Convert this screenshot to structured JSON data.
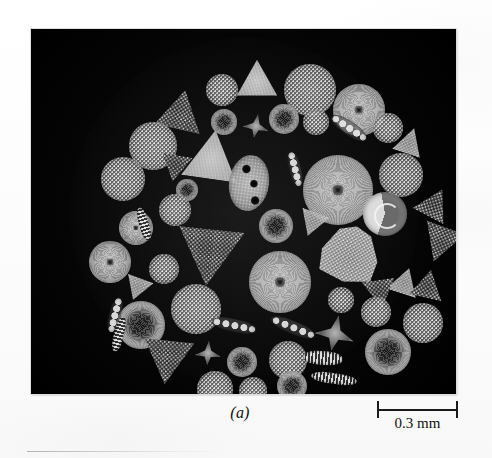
{
  "figure": {
    "caption": "(a)",
    "scale_bar": {
      "label": "0.3 mm",
      "length_px": 81
    },
    "plate": {
      "background_color": "#050505",
      "description": "Dark-field micrograph of an arranged slide of diatom frustules forming a circular mosaic"
    }
  },
  "colors": {
    "page_background": "#ffffff",
    "plate_background": "#050505",
    "ink": "#111111",
    "rule": "#787878"
  },
  "specimens": [
    {
      "name": "triangular-dark-1",
      "type": "triangle-dark",
      "x": 126,
      "y": 60,
      "w": 48,
      "h": 42,
      "rot": 12
    },
    {
      "name": "centric-porous-1",
      "type": "porous",
      "x": 175,
      "y": 45,
      "w": 32,
      "h": 32,
      "rot": 0
    },
    {
      "name": "triangular-bright-1",
      "type": "triangle-bright",
      "x": 205,
      "y": 30,
      "w": 42,
      "h": 38,
      "rot": 0
    },
    {
      "name": "centric-porous-2",
      "type": "porous",
      "x": 253,
      "y": 35,
      "w": 52,
      "h": 52,
      "rot": 0
    },
    {
      "name": "centric-radial-1",
      "type": "centric",
      "x": 302,
      "y": 55,
      "w": 52,
      "h": 52,
      "rot": 0
    },
    {
      "name": "centric-porous-3",
      "type": "porous",
      "x": 342,
      "y": 84,
      "w": 30,
      "h": 30,
      "rot": 0
    },
    {
      "name": "triangular-mid-1",
      "type": "triangle",
      "x": 364,
      "y": 98,
      "w": 30,
      "h": 28,
      "rot": 18
    },
    {
      "name": "centric-porous-4",
      "type": "porous",
      "x": 98,
      "y": 93,
      "w": 48,
      "h": 48,
      "rot": 0
    },
    {
      "name": "centric-ring-1",
      "type": "ring",
      "x": 180,
      "y": 80,
      "w": 26,
      "h": 26,
      "rot": 0
    },
    {
      "name": "triradiate-1",
      "type": "triradiate",
      "x": 212,
      "y": 85,
      "w": 26,
      "h": 24,
      "rot": 10
    },
    {
      "name": "centric-ring-2",
      "type": "ring",
      "x": 238,
      "y": 75,
      "w": 30,
      "h": 30,
      "rot": 0
    },
    {
      "name": "centric-porous-5",
      "type": "porous",
      "x": 272,
      "y": 80,
      "w": 26,
      "h": 26,
      "rot": 0
    },
    {
      "name": "rod-chain-1",
      "type": "rod-lumpy",
      "x": 297,
      "y": 92,
      "w": 42,
      "h": 14,
      "rot": 34
    },
    {
      "name": "triangular-bright-2",
      "type": "triangle-bright",
      "x": 152,
      "y": 100,
      "w": 58,
      "h": 52,
      "rot": 8
    },
    {
      "name": "triangular-dark-2",
      "type": "triangle-dark",
      "x": 128,
      "y": 125,
      "w": 32,
      "h": 28,
      "rot": 190
    },
    {
      "name": "centric-porous-6",
      "type": "porous",
      "x": 70,
      "y": 128,
      "w": 44,
      "h": 44,
      "rot": 0
    },
    {
      "name": "ellipse-ocelli-1",
      "type": "ellipse-ocelli",
      "x": 198,
      "y": 126,
      "w": 40,
      "h": 56,
      "rot": 8
    },
    {
      "name": "rod-chain-2",
      "type": "rod-lumpy",
      "x": 246,
      "y": 134,
      "w": 36,
      "h": 12,
      "rot": 76
    },
    {
      "name": "centric-radial-large-1",
      "type": "centric",
      "x": 272,
      "y": 126,
      "w": 70,
      "h": 70,
      "rot": 0
    },
    {
      "name": "centric-porous-7",
      "type": "porous",
      "x": 348,
      "y": 124,
      "w": 44,
      "h": 44,
      "rot": 0
    },
    {
      "name": "centric-ring-3",
      "type": "ring",
      "x": 145,
      "y": 150,
      "w": 22,
      "h": 22,
      "rot": 0
    },
    {
      "name": "centric-porous-8",
      "type": "porous",
      "x": 128,
      "y": 165,
      "w": 32,
      "h": 32,
      "rot": 0
    },
    {
      "name": "annulus-1",
      "type": "annulus",
      "x": 48,
      "y": 175,
      "w": 40,
      "h": 40,
      "rot": 0
    },
    {
      "name": "centric-radial-2",
      "type": "centric",
      "x": 88,
      "y": 182,
      "w": 34,
      "h": 34,
      "rot": 0
    },
    {
      "name": "spiral-1",
      "type": "spiral",
      "x": 332,
      "y": 163,
      "w": 44,
      "h": 44,
      "rot": 0
    },
    {
      "name": "triangular-dark-3",
      "type": "triangle-dark",
      "x": 386,
      "y": 158,
      "w": 36,
      "h": 32,
      "rot": 28
    },
    {
      "name": "centric-ring-4",
      "type": "ring",
      "x": 228,
      "y": 180,
      "w": 34,
      "h": 34,
      "rot": 0
    },
    {
      "name": "triangular-mid-2",
      "type": "triangle",
      "x": 266,
      "y": 182,
      "w": 30,
      "h": 26,
      "rot": 200
    },
    {
      "name": "roundtri-large-1",
      "type": "roundtri",
      "x": 288,
      "y": 196,
      "w": 62,
      "h": 58,
      "rot": 14
    },
    {
      "name": "triangular-dark-4",
      "type": "triangle-dark",
      "x": 388,
      "y": 196,
      "w": 42,
      "h": 38,
      "rot": 200
    },
    {
      "name": "triangular-dark-5",
      "type": "triangle-dark",
      "x": 144,
      "y": 198,
      "w": 68,
      "h": 60,
      "rot": 186
    },
    {
      "name": "rod-chain-3",
      "type": "rod",
      "x": 96,
      "y": 190,
      "w": 34,
      "h": 10,
      "rot": 74
    },
    {
      "name": "centric-radial-3",
      "type": "centric",
      "x": 58,
      "y": 212,
      "w": 42,
      "h": 42,
      "rot": 0
    },
    {
      "name": "centric-porous-9",
      "type": "porous",
      "x": 118,
      "y": 225,
      "w": 30,
      "h": 30,
      "rot": 0
    },
    {
      "name": "centric-radial-large-2",
      "type": "centric",
      "x": 218,
      "y": 222,
      "w": 62,
      "h": 62,
      "rot": 0
    },
    {
      "name": "triangular-mid-3",
      "type": "triangle",
      "x": 358,
      "y": 238,
      "w": 32,
      "h": 28,
      "rot": 18
    },
    {
      "name": "centric-porous-10",
      "type": "porous",
      "x": 297,
      "y": 258,
      "w": 26,
      "h": 26,
      "rot": 0
    },
    {
      "name": "triangular-dark-6",
      "type": "triangle-dark",
      "x": 332,
      "y": 250,
      "w": 34,
      "h": 30,
      "rot": 172
    },
    {
      "name": "triangular-dark-7",
      "type": "triangle-dark",
      "x": 380,
      "y": 240,
      "w": 34,
      "h": 30,
      "rot": 12
    },
    {
      "name": "centric-porous-11",
      "type": "porous",
      "x": 140,
      "y": 255,
      "w": 50,
      "h": 50,
      "rot": 0
    },
    {
      "name": "triangular-mid-4",
      "type": "triangle",
      "x": 92,
      "y": 248,
      "w": 28,
      "h": 24,
      "rot": 200
    },
    {
      "name": "centric-ring-5",
      "type": "ring",
      "x": 86,
      "y": 272,
      "w": 48,
      "h": 48,
      "rot": 0
    },
    {
      "name": "rod-chain-4",
      "type": "rod-lumpy",
      "x": 66,
      "y": 280,
      "w": 36,
      "h": 12,
      "rot": 104
    },
    {
      "name": "rod-chain-5",
      "type": "rod-lumpy",
      "x": 180,
      "y": 290,
      "w": 46,
      "h": 13,
      "rot": 12
    },
    {
      "name": "rod-chain-6",
      "type": "rod-lumpy",
      "x": 238,
      "y": 292,
      "w": 48,
      "h": 13,
      "rot": 22
    },
    {
      "name": "triradiate-2",
      "type": "triradiate",
      "x": 284,
      "y": 286,
      "w": 40,
      "h": 36,
      "rot": 12
    },
    {
      "name": "centric-porous-12",
      "type": "porous",
      "x": 330,
      "y": 268,
      "w": 30,
      "h": 30,
      "rot": 0
    },
    {
      "name": "centric-porous-13",
      "type": "porous",
      "x": 372,
      "y": 274,
      "w": 40,
      "h": 40,
      "rot": 0
    },
    {
      "name": "triangular-dark-8",
      "type": "triangle-dark",
      "x": 110,
      "y": 310,
      "w": 52,
      "h": 46,
      "rot": 186
    },
    {
      "name": "rod-chain-7",
      "type": "rod",
      "x": 70,
      "y": 300,
      "w": 36,
      "h": 10,
      "rot": 104
    },
    {
      "name": "triradiate-3",
      "type": "triradiate",
      "x": 164,
      "y": 312,
      "w": 26,
      "h": 24,
      "rot": 4
    },
    {
      "name": "centric-ring-6",
      "type": "ring",
      "x": 196,
      "y": 318,
      "w": 30,
      "h": 30,
      "rot": 0
    },
    {
      "name": "centric-porous-14",
      "type": "porous",
      "x": 238,
      "y": 312,
      "w": 38,
      "h": 38,
      "rot": 0
    },
    {
      "name": "rod-chain-8",
      "type": "rod",
      "x": 272,
      "y": 322,
      "w": 40,
      "h": 14,
      "rot": 4
    },
    {
      "name": "centric-ring-7",
      "type": "ring",
      "x": 334,
      "y": 300,
      "w": 46,
      "h": 46,
      "rot": 0
    },
    {
      "name": "centric-porous-15",
      "type": "porous",
      "x": 166,
      "y": 342,
      "w": 36,
      "h": 36,
      "rot": 0
    },
    {
      "name": "centric-porous-16",
      "type": "porous",
      "x": 208,
      "y": 348,
      "w": 28,
      "h": 28,
      "rot": 0
    },
    {
      "name": "centric-ring-8",
      "type": "ring",
      "x": 246,
      "y": 342,
      "w": 30,
      "h": 30,
      "rot": 0
    },
    {
      "name": "rod-chain-9",
      "type": "rod",
      "x": 280,
      "y": 344,
      "w": 46,
      "h": 11,
      "rot": 8
    }
  ]
}
